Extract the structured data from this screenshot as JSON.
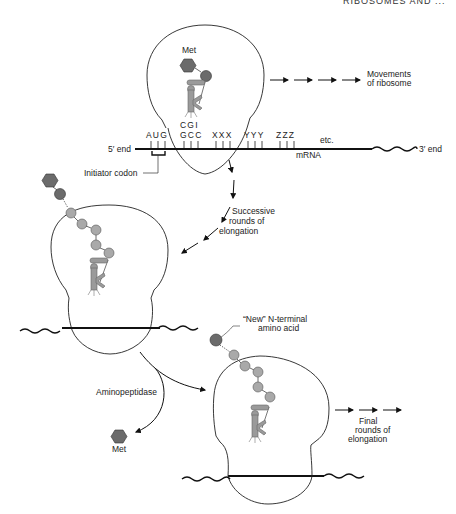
{
  "header": {
    "running_title": "RIBOSOMES AND ..."
  },
  "panel1": {
    "met_label": "Met",
    "anticodon_top": "CGI",
    "codons": [
      "AUG",
      "GCC",
      "XXX",
      "YYY",
      "ZZZ"
    ],
    "etc_label": "etc.",
    "five_prime_label": "5′ end",
    "three_prime_label": "3′ end",
    "mrna_label": "mRNA",
    "initiator_label": "Initiator codon",
    "movement_label_line1": "Movements",
    "movement_label_line2": "of ribosome"
  },
  "panel2": {
    "elongation_label_line1": "Successive",
    "elongation_label_line2": "rounds of",
    "elongation_label_line3": "elongation"
  },
  "panel3": {
    "aminopeptidase_label": "Aminopeptidase",
    "released_met_label": "Met",
    "new_terminal_line1": "“New” N-terminal",
    "new_terminal_line2": "amino acid",
    "final_label_line1": "Final",
    "final_label_line2": "rounds of",
    "final_label_line3": "elongation"
  },
  "colors": {
    "met_residue": "#6b6b6b",
    "amino_acid": "#a9a9a9",
    "trna": "#9a9a9a",
    "line": "#111111"
  }
}
